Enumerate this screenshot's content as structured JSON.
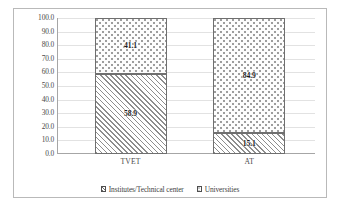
{
  "chart_data": {
    "type": "bar",
    "stacked": true,
    "title": "",
    "subtitle": "",
    "xlabel": "",
    "ylabel": "",
    "categories": [
      "TVET",
      "AT"
    ],
    "series": [
      {
        "name": "Institutes/Technical center",
        "values": [
          58.9,
          15.1
        ],
        "pattern": "diagonal-hatch"
      },
      {
        "name": "Universities",
        "values": [
          41.1,
          84.9
        ],
        "pattern": "dotted"
      }
    ],
    "ylim": [
      0.0,
      100.0
    ],
    "ytick_step": 10.0,
    "yticks": [
      "0.0",
      "10.0",
      "20.0",
      "30.0",
      "40.0",
      "50.0",
      "60.0",
      "70.0",
      "80.0",
      "90.0",
      "100.0"
    ],
    "grid": true,
    "grid_axis": "y",
    "legend_position": "bottom",
    "data_labels": [
      {
        "category": "TVET",
        "series": "Universities",
        "text": "41.1"
      },
      {
        "category": "TVET",
        "series": "Institutes/Technical center",
        "text": "58.9"
      },
      {
        "category": "AT",
        "series": "Universities",
        "text": "84.9"
      },
      {
        "category": "AT",
        "series": "Institutes/Technical center",
        "text": "15.1"
      }
    ],
    "colors": {
      "hatch_stroke": "#8d8d8d",
      "dot_fill": "#9a9a9a",
      "segment_border": "#6f6f6f",
      "gridline": "#e2e2e2",
      "axis_line": "#a6a6a6",
      "frame_border": "#b9b9b9",
      "background": "#ffffff",
      "label_text": "#4a4a4a",
      "value_text": "#1c1c1c"
    }
  },
  "axis": {
    "y": {
      "ticks": [
        {
          "value": 100.0,
          "label": "100.0"
        },
        {
          "value": 90.0,
          "label": "90.0"
        },
        {
          "value": 80.0,
          "label": "80.0"
        },
        {
          "value": 70.0,
          "label": "70.0"
        },
        {
          "value": 60.0,
          "label": "60.0"
        },
        {
          "value": 50.0,
          "label": "50.0"
        },
        {
          "value": 40.0,
          "label": "40.0"
        },
        {
          "value": 30.0,
          "label": "30.0"
        },
        {
          "value": 20.0,
          "label": "20.0"
        },
        {
          "value": 10.0,
          "label": "10.0"
        },
        {
          "value": 0.0,
          "label": "0.0"
        }
      ]
    },
    "x": {
      "ticks": [
        {
          "label": "TVET"
        },
        {
          "label": "AT"
        }
      ]
    }
  },
  "bars": [
    {
      "category": "TVET",
      "top": {
        "series": "Universities",
        "value": 41.1,
        "label": "41.1"
      },
      "bottom": {
        "series": "Institutes/Technical center",
        "value": 58.9,
        "label": "58.9"
      }
    },
    {
      "category": "AT",
      "top": {
        "series": "Universities",
        "value": 84.9,
        "label": "84.9"
      },
      "bottom": {
        "series": "Institutes/Technical center",
        "value": 15.1,
        "label": "15.1"
      }
    }
  ],
  "legend": {
    "items": [
      {
        "label": "Institutes/Technical center",
        "swatch": "hatch-swatch-icon"
      },
      {
        "label": "Universities",
        "swatch": "dots-swatch-icon"
      }
    ]
  }
}
